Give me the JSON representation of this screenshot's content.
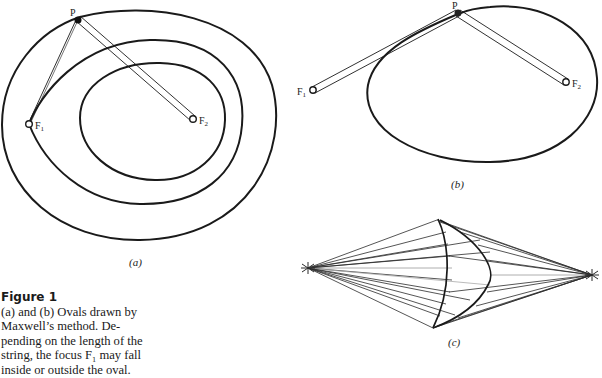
{
  "figure": {
    "panels": [
      {
        "id": "a",
        "label": "(a)",
        "points": {
          "P": "P",
          "F1": "F",
          "F1_sub": "1",
          "F2": "F",
          "F2_sub": "2"
        },
        "curves": [
          "outer-oval",
          "middle-oval",
          "inner-oval"
        ]
      },
      {
        "id": "b",
        "label": "(b)",
        "points": {
          "P": "P",
          "F1": "F",
          "F1_sub": "1",
          "F2": "F",
          "F2_sub": "2"
        },
        "curves": [
          "oval"
        ]
      },
      {
        "id": "c",
        "label": "(c)",
        "curves": [
          "left-arc",
          "right-arc",
          "ray-fan"
        ]
      }
    ]
  },
  "caption": {
    "title": "Figure 1",
    "lines": [
      "(a) and (b) Ovals drawn by",
      "Maxwell’s method. De-",
      "pending on the length of the",
      "string, the focus F₁ may fall",
      "inside or outside the oval."
    ]
  }
}
